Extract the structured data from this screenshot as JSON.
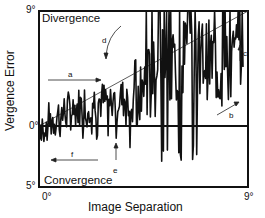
{
  "chart_data": {
    "type": "line",
    "title": "",
    "xlabel": "Image Separation",
    "ylabel": "Vergence Error",
    "xlim": [
      0,
      9
    ],
    "ylim": [
      -5,
      9
    ],
    "x_ticks": [
      "0°",
      "9°"
    ],
    "y_ticks": [
      "5°",
      "0°",
      "9°"
    ],
    "region_labels": {
      "top": "Divergence",
      "bottom": "Convergence"
    },
    "reference_lines": [
      {
        "name": "zero-error",
        "y": 0
      },
      {
        "name": "ramp",
        "from": [
          0,
          0
        ],
        "to": [
          9,
          9
        ]
      }
    ],
    "annotations": [
      {
        "label": "a",
        "type": "arrow-right",
        "x": 1.5,
        "y": 2.6
      },
      {
        "label": "b",
        "type": "arrow-up-right",
        "x": 8.2,
        "y": 1.3
      },
      {
        "label": "c",
        "type": "arrow-up",
        "x": 8.7,
        "y": 5.3
      },
      {
        "label": "d",
        "type": "curved-arrow-down",
        "x": 4.7,
        "y": 6.8
      },
      {
        "label": "e",
        "type": "arrow-up",
        "x": 4.5,
        "y": -2.0
      },
      {
        "label": "f",
        "type": "arrow-left",
        "x": 1.3,
        "y": -1.9
      }
    ],
    "series": [
      {
        "name": "vergence-error-trace",
        "description": "Noisy trace hovering near 0° for small separations (0–4°), then rising with large swings toward the 9° ceiling as separation increases, with one dip back to ~0.5° near 8°",
        "x": [
          0,
          0.5,
          1,
          1.5,
          2,
          2.5,
          3,
          3.5,
          4,
          4.5,
          5,
          5.5,
          6,
          6.5,
          7,
          7.5,
          8,
          8.5,
          8.8
        ],
        "values": [
          0.2,
          0.4,
          1.0,
          1.3,
          1.8,
          2.0,
          1.9,
          2.2,
          2.0,
          3.0,
          3.6,
          4.8,
          4.5,
          6.5,
          5.5,
          5.0,
          3.8,
          5.5,
          6.5
        ]
      }
    ],
    "grid": false,
    "legend": null
  }
}
